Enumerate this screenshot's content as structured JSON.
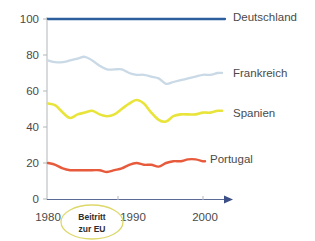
{
  "chart_data": {
    "type": "line",
    "title": "",
    "xlabel": "",
    "ylabel": "",
    "xlim": [
      1980,
      2004
    ],
    "ylim": [
      0,
      100
    ],
    "xticks": [
      1980,
      1990,
      2000
    ],
    "yticks": [
      0,
      20,
      40,
      60,
      80,
      100
    ],
    "grid": false,
    "legend_position": "right-inline",
    "annotations": [
      {
        "text_line1": "Beitritt",
        "text_line2": "zur EU",
        "shape": "ellipse",
        "x": 1983
      }
    ],
    "x": [
      1980,
      1981,
      1982,
      1983,
      1984,
      1985,
      1986,
      1987,
      1988,
      1989,
      1990,
      1991,
      1992,
      1993,
      1994,
      1995,
      1996,
      1997,
      1998,
      1999,
      2000,
      2001,
      2002,
      2003,
      2004
    ],
    "series": [
      {
        "name": "Deutschland",
        "color": "#2d5f9e",
        "values": [
          100,
          100,
          100,
          100,
          100,
          100,
          100,
          100,
          100,
          100,
          100,
          100,
          100,
          100,
          100,
          100,
          100,
          100,
          100,
          100,
          100,
          100,
          100,
          100,
          100
        ]
      },
      {
        "name": "Frankreich",
        "color": "#c9d9e6",
        "values": [
          77,
          76,
          76,
          77,
          78,
          79,
          77,
          74,
          72,
          72,
          72,
          70,
          69,
          69,
          68,
          67,
          64,
          65,
          66,
          67,
          68,
          69,
          69,
          70,
          70
        ]
      },
      {
        "name": "Spanien",
        "color": "#e9e43a",
        "values": [
          53,
          52,
          48,
          45,
          47,
          48,
          49,
          47,
          46,
          47,
          50,
          53,
          55,
          53,
          48,
          44,
          43,
          46,
          47,
          47,
          47,
          48,
          48,
          49,
          49
        ]
      },
      {
        "name": "Portugal",
        "color": "#e75a3b",
        "values": [
          20,
          19,
          17,
          16,
          16,
          16,
          16,
          16,
          15,
          16,
          17,
          19,
          20,
          19,
          19,
          18,
          20,
          21,
          21,
          22,
          22,
          21,
          20,
          20,
          20
        ]
      }
    ]
  },
  "axis": {
    "y_tick_labels": [
      "100",
      "80",
      "60",
      "40",
      "20",
      "0"
    ],
    "x_tick_labels": [
      "1980",
      "1990",
      "2000"
    ]
  },
  "legend": {
    "items": [
      {
        "label": "Deutschland"
      },
      {
        "label": "Frankreich"
      },
      {
        "label": "Spanien"
      },
      {
        "label": "Portugal"
      }
    ]
  },
  "annotation": {
    "line1": "Beitritt",
    "line2": "zur EU",
    "outline_color": "#ddd86a"
  }
}
